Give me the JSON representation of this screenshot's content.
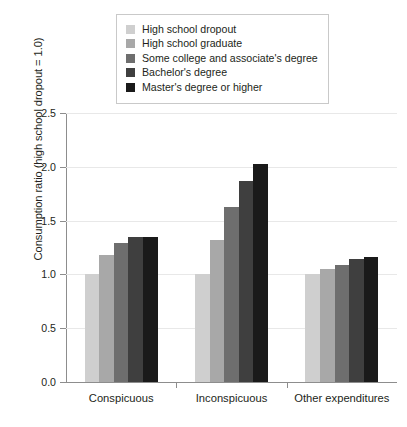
{
  "chart_data": {
    "type": "bar",
    "title": "",
    "xlabel": "",
    "ylabel": "Consumption ratio (high school dropout = 1.0)",
    "categories": [
      "Conspicuous",
      "Inconspicuous",
      "Other expenditures"
    ],
    "ylim": [
      0.0,
      2.5
    ],
    "ytick_labels": [
      "0.0",
      "0.5",
      "1.0",
      "1.5",
      "2.0",
      "2.5"
    ],
    "ytick_values": [
      0.0,
      0.5,
      1.0,
      1.5,
      2.0,
      2.5
    ],
    "grid": "horizontal",
    "legend_position": "top-center",
    "series": [
      {
        "name": "High school dropout",
        "color": "#cfcfcf",
        "values": [
          1.0,
          1.0,
          1.0
        ]
      },
      {
        "name": "High school graduate",
        "color": "#a8a8a8",
        "values": [
          1.18,
          1.32,
          1.05
        ]
      },
      {
        "name": "Some college and associate's degree",
        "color": "#6e6e6e",
        "values": [
          1.29,
          1.63,
          1.09
        ]
      },
      {
        "name": "Bachelor's degree",
        "color": "#3f3f3f",
        "values": [
          1.35,
          1.87,
          1.14
        ]
      },
      {
        "name": "Master's degree or higher",
        "color": "#1a1a1a",
        "values": [
          1.35,
          2.03,
          1.16
        ]
      }
    ]
  }
}
